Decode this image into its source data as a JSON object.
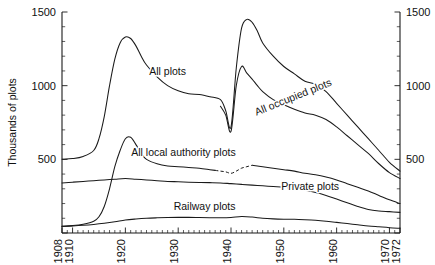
{
  "chart_data": {
    "type": "line",
    "title": "",
    "subtitle": "",
    "xlabel": "",
    "ylabel": "Thousands of plots",
    "ylabel_right": "Thousands of plots",
    "xlim": [
      1908,
      1972
    ],
    "ylim": [
      0,
      1500
    ],
    "grid": false,
    "legend_position": "inline-labels",
    "y_ticks_major": [
      0,
      500,
      1000,
      1500
    ],
    "y_tick_labels": [
      "",
      "500",
      "1000",
      "1500"
    ],
    "y_ticks_minor_step": 100,
    "x_ticks_labeled": [
      1908,
      1910,
      1920,
      1930,
      1940,
      1950,
      1960,
      1970,
      1972
    ],
    "x_tick_labels": [
      "1908",
      "1910",
      "1920",
      "1930",
      "1940",
      "1950",
      "1960",
      "1970",
      "1972"
    ],
    "x_ticks_minor_step": 1,
    "axes_both_sides": true,
    "series": [
      {
        "name": "All plots",
        "label": "All plots",
        "style": "solid",
        "x": [
          1908,
          1910,
          1912,
          1914,
          1915,
          1916,
          1917,
          1918,
          1919,
          1920,
          1921,
          1922,
          1923,
          1924,
          1926,
          1928,
          1930,
          1932,
          1934,
          1936,
          1938,
          1939,
          1940,
          1941,
          1942,
          1943,
          1944,
          1945,
          1946,
          1948,
          1950,
          1952,
          1954,
          1956,
          1958,
          1960,
          1962,
          1964,
          1966,
          1968,
          1970,
          1972
        ],
        "y": [
          500,
          505,
          520,
          560,
          640,
          790,
          1000,
          1180,
          1290,
          1330,
          1320,
          1270,
          1200,
          1140,
          1060,
          1000,
          965,
          945,
          940,
          925,
          905,
          830,
          720,
          1120,
          1390,
          1450,
          1430,
          1370,
          1290,
          1200,
          1130,
          1080,
          1030,
          1010,
          960,
          880,
          800,
          720,
          640,
          560,
          480,
          420
        ]
      },
      {
        "name": "All occupied plots",
        "label": "All occupied plots",
        "style": "solid",
        "x": [
          1938,
          1939,
          1940,
          1941,
          1942,
          1943,
          1944,
          1945,
          1946,
          1948,
          1950,
          1952,
          1954,
          1956,
          1958,
          1960,
          1962,
          1964,
          1966,
          1968,
          1970,
          1972
        ],
        "y": [
          860,
          800,
          690,
          1000,
          1130,
          1085,
          1045,
          1000,
          960,
          905,
          870,
          840,
          815,
          800,
          770,
          720,
          660,
          600,
          540,
          470,
          410,
          370
        ]
      },
      {
        "name": "All local authority plots",
        "label": "All local authority plots",
        "style": "solid-with-dashed-segment",
        "dashed_range": [
          1937,
          1944
        ],
        "x": [
          1908,
          1910,
          1912,
          1914,
          1915,
          1916,
          1917,
          1918,
          1919,
          1920,
          1921,
          1922,
          1923,
          1924,
          1926,
          1928,
          1930,
          1932,
          1934,
          1936,
          1937,
          1938,
          1939,
          1940,
          1941,
          1942,
          1943,
          1944,
          1945,
          1946,
          1948,
          1950,
          1952,
          1954,
          1956,
          1958,
          1960,
          1962,
          1964,
          1966,
          1968,
          1970,
          1972
        ],
        "y": [
          45,
          50,
          60,
          80,
          110,
          180,
          300,
          450,
          560,
          640,
          650,
          600,
          540,
          500,
          470,
          455,
          450,
          445,
          440,
          430,
          425,
          420,
          415,
          405,
          420,
          440,
          450,
          460,
          455,
          450,
          440,
          430,
          420,
          405,
          395,
          380,
          360,
          335,
          310,
          285,
          255,
          225,
          200
        ]
      },
      {
        "name": "Private plots",
        "label": "Private plots",
        "style": "solid",
        "x": [
          1908,
          1910,
          1912,
          1914,
          1916,
          1918,
          1920,
          1922,
          1924,
          1926,
          1928,
          1930,
          1932,
          1934,
          1936,
          1938,
          1940,
          1942,
          1944,
          1946,
          1948,
          1950,
          1952,
          1954,
          1956,
          1958,
          1960,
          1962,
          1964,
          1966,
          1968,
          1970,
          1972
        ],
        "y": [
          340,
          345,
          350,
          355,
          360,
          365,
          370,
          365,
          360,
          355,
          350,
          348,
          345,
          343,
          342,
          340,
          335,
          330,
          325,
          320,
          315,
          310,
          300,
          290,
          275,
          255,
          230,
          205,
          180,
          160,
          150,
          145,
          140
        ]
      },
      {
        "name": "Railway plots",
        "label": "Railway plots",
        "style": "solid",
        "x": [
          1908,
          1910,
          1912,
          1914,
          1916,
          1918,
          1920,
          1922,
          1924,
          1926,
          1928,
          1930,
          1932,
          1934,
          1936,
          1938,
          1940,
          1942,
          1944,
          1946,
          1948,
          1950,
          1952,
          1954,
          1956,
          1958,
          1960,
          1962,
          1964,
          1966,
          1968,
          1970,
          1972
        ],
        "y": [
          45,
          48,
          52,
          58,
          66,
          76,
          88,
          95,
          100,
          103,
          105,
          106,
          106,
          105,
          104,
          103,
          105,
          112,
          108,
          100,
          96,
          94,
          93,
          90,
          86,
          80,
          72,
          64,
          56,
          48,
          42,
          36,
          32
        ]
      }
    ],
    "annotations": [
      {
        "name": "all-plots-label",
        "text": "All plots",
        "x": 1928,
        "y": 1075,
        "rotation": 0
      },
      {
        "name": "all-occupied-plots-label",
        "text": "All occupied plots",
        "x": 1952,
        "y": 900,
        "rotation": -22
      },
      {
        "name": "all-local-authority-plots-label",
        "text": "All local authority plots",
        "x": 1931,
        "y": 520,
        "rotation": 0
      },
      {
        "name": "private-plots-label",
        "text": "Private plots",
        "x": 1955,
        "y": 290,
        "rotation": 0
      },
      {
        "name": "railway-plots-label",
        "text": "Railway plots",
        "x": 1935,
        "y": 155,
        "rotation": 0
      }
    ]
  },
  "axes": {
    "y_title_left": "Thousands of plots",
    "y_labels": [
      "1500",
      "1000",
      "500"
    ],
    "y_labels_right": [
      "1500",
      "1000",
      "500"
    ],
    "x_labels": [
      "1908",
      "1910",
      "1920",
      "1930",
      "1940",
      "1950",
      "1960",
      "1970",
      "1972"
    ]
  },
  "colors": {
    "ink": "#1a1a1a",
    "background": "#ffffff"
  }
}
